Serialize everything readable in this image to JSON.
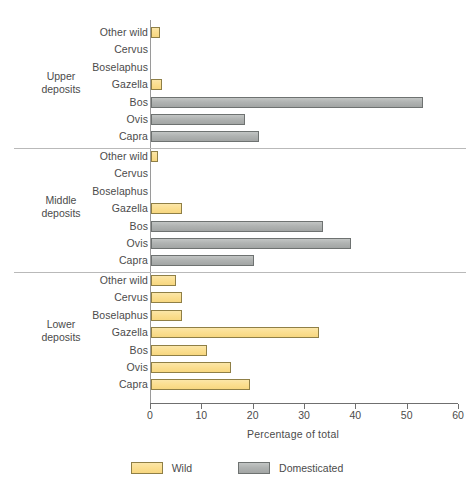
{
  "chart_data": {
    "type": "bar",
    "orientation": "horizontal",
    "title": "",
    "xlabel": "Percentage of total",
    "ylabel": "",
    "xlim": [
      0,
      60
    ],
    "xticks": [
      0,
      10,
      20,
      30,
      40,
      50,
      60
    ],
    "xtick_labels": [
      "0",
      "10",
      "20",
      "30",
      "40",
      "50",
      "60"
    ],
    "grid": false,
    "legend": {
      "position": "bottom-center",
      "entries": [
        {
          "name": "Wild",
          "color": "#FBDF92"
        },
        {
          "name": "Domesticated",
          "color": "#B0B3B2"
        }
      ]
    },
    "categories": [
      "Other wild",
      "Cervus",
      "Boselaphus",
      "Gazella",
      "Bos",
      "Ovis",
      "Capra"
    ],
    "groups": [
      {
        "name": "Upper deposits",
        "name_line1": "Upper",
        "name_line2": "deposits",
        "rows": [
          {
            "label": "Other wild",
            "value": 1.8,
            "series": "Wild"
          },
          {
            "label": "Cervus",
            "value": 0,
            "series": "Wild"
          },
          {
            "label": "Boselaphus",
            "value": 0,
            "series": "Wild"
          },
          {
            "label": "Gazella",
            "value": 2.2,
            "series": "Wild"
          },
          {
            "label": "Bos",
            "value": 53.0,
            "series": "Domesticated"
          },
          {
            "label": "Ovis",
            "value": 18.4,
            "series": "Domesticated"
          },
          {
            "label": "Capra",
            "value": 21.0,
            "series": "Domesticated"
          }
        ]
      },
      {
        "name": "Middle deposits",
        "name_line1": "Middle",
        "name_line2": "deposits",
        "rows": [
          {
            "label": "Other wild",
            "value": 1.4,
            "series": "Wild"
          },
          {
            "label": "Cervus",
            "value": 0,
            "series": "Wild"
          },
          {
            "label": "Boselaphus",
            "value": 0,
            "series": "Wild"
          },
          {
            "label": "Gazella",
            "value": 6.0,
            "series": "Wild"
          },
          {
            "label": "Bos",
            "value": 33.5,
            "series": "Domesticated"
          },
          {
            "label": "Ovis",
            "value": 39.0,
            "series": "Domesticated"
          },
          {
            "label": "Capra",
            "value": 20.0,
            "series": "Domesticated"
          }
        ]
      },
      {
        "name": "Lower deposits",
        "name_line1": "Lower",
        "name_line2": "deposits",
        "rows": [
          {
            "label": "Other wild",
            "value": 4.9,
            "series": "Wild"
          },
          {
            "label": "Cervus",
            "value": 6.1,
            "series": "Wild"
          },
          {
            "label": "Boselaphus",
            "value": 6.1,
            "series": "Wild"
          },
          {
            "label": "Gazella",
            "value": 32.7,
            "series": "Wild"
          },
          {
            "label": "Bos",
            "value": 11.0,
            "series": "Wild"
          },
          {
            "label": "Ovis",
            "value": 15.5,
            "series": "Wild"
          },
          {
            "label": "Capra",
            "value": 19.2,
            "series": "Wild"
          }
        ]
      }
    ]
  }
}
